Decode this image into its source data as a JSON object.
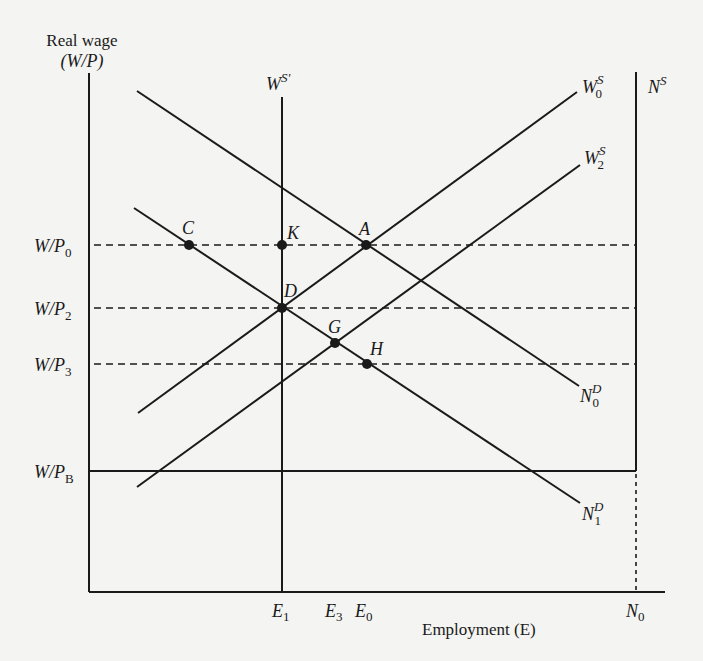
{
  "figure": {
    "y_axis_title_line1": "Real wage",
    "y_axis_title_line2": "(W/P)",
    "x_axis_title": "Employment (E)",
    "colors": {
      "ink": "#1a1a1a",
      "background": "#f4f4f2"
    }
  },
  "y_labels": {
    "wp0": {
      "main": "W/P",
      "sub": "0"
    },
    "wp2": {
      "main": "W/P",
      "sub": "2"
    },
    "wp3": {
      "main": "W/P",
      "sub": "3"
    },
    "wpb": {
      "main": "W/P",
      "sub": "B"
    }
  },
  "x_labels": {
    "e1": {
      "main": "E",
      "sub": "1"
    },
    "e3": {
      "main": "E",
      "sub": "3"
    },
    "e0": {
      "main": "E",
      "sub": "0"
    },
    "n0": {
      "main": "N",
      "sub": "0"
    }
  },
  "curves": {
    "ws_prime": {
      "main": "W",
      "sup": "S'"
    },
    "ws0": {
      "main": "W",
      "sup": "S",
      "sub": "0"
    },
    "ws2": {
      "main": "W",
      "sup": "S",
      "sub": "2"
    },
    "ns": {
      "main": "N",
      "sup": "S"
    },
    "nd0": {
      "main": "N",
      "sup": "D",
      "sub": "0"
    },
    "nd1": {
      "main": "N",
      "sup": "D",
      "sub": "1"
    }
  },
  "points": {
    "C": "C",
    "K": "K",
    "A": "A",
    "D": "D",
    "G": "G",
    "H": "H"
  }
}
